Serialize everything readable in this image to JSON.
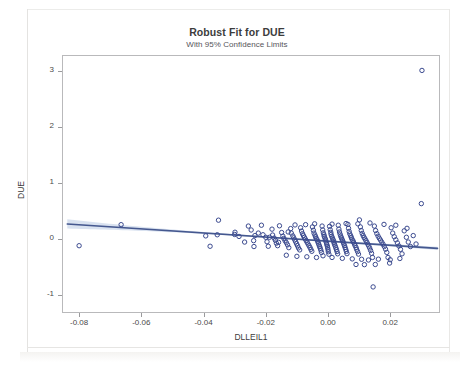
{
  "chart_data": {
    "type": "scatter",
    "title": "Robust Fit for DUE",
    "subtitle": "With 95% Confidence Limits",
    "xlabel": "DLLEIL1",
    "ylabel": "DUE",
    "xlim": [
      -0.0855,
      0.036
    ],
    "ylim": [
      -1.32,
      3.28
    ],
    "xticks": [
      -0.08,
      -0.06,
      -0.04,
      -0.02,
      0.0,
      0.02
    ],
    "xtick_labels": [
      "-0.08",
      "-0.06",
      "-0.04",
      "-0.02",
      "0.00",
      "0.02"
    ],
    "yticks": [
      -1,
      0,
      1,
      2,
      3
    ],
    "ytick_labels": [
      "-1",
      "0",
      "1",
      "2",
      "3"
    ],
    "grid": false,
    "legend": null,
    "marker": {
      "shape": "open-circle",
      "color": "#3b4a8f",
      "size": 4.4,
      "stroke_width": 1.0
    },
    "fit_line": {
      "label": "Robust fit",
      "color": "#45588f",
      "width": 1.6,
      "x_start": -0.0838,
      "y_start": 0.268,
      "x_end": 0.0352,
      "y_end": -0.168,
      "slope": -3.66,
      "intercept": -0.0386
    },
    "confidence_band": {
      "label": "95% Confidence Limits",
      "level": 0.95,
      "fill_color": "#b9cbe4",
      "opacity": 0.55,
      "half_width_at_xmin": 0.082,
      "half_width_at_center": 0.012,
      "half_width_at_xmax": 0.03
    },
    "points": [
      [
        -0.08,
        -0.12
      ],
      [
        -0.0665,
        0.255
      ],
      [
        -0.0393,
        0.055
      ],
      [
        -0.0352,
        0.335
      ],
      [
        -0.0356,
        0.075
      ],
      [
        -0.0379,
        -0.13
      ],
      [
        -0.03,
        0.08
      ],
      [
        -0.0299,
        0.12
      ],
      [
        -0.0256,
        0.23
      ],
      [
        -0.0247,
        0.16
      ],
      [
        -0.0235,
        0.06
      ],
      [
        -0.0239,
        -0.03
      ],
      [
        -0.0238,
        -0.135
      ],
      [
        -0.0214,
        0.245
      ],
      [
        -0.0209,
        0.075
      ],
      [
        -0.02,
        0.03
      ],
      [
        -0.0196,
        -0.05
      ],
      [
        -0.0192,
        -0.13
      ],
      [
        -0.018,
        0.175
      ],
      [
        -0.0178,
        0.07
      ],
      [
        -0.0173,
        0.015
      ],
      [
        -0.0169,
        -0.025
      ],
      [
        -0.0166,
        -0.075
      ],
      [
        -0.0162,
        -0.12
      ],
      [
        -0.0156,
        0.235
      ],
      [
        -0.0149,
        0.115
      ],
      [
        -0.0145,
        0.05
      ],
      [
        -0.0142,
        0.01
      ],
      [
        -0.0138,
        -0.03
      ],
      [
        -0.0134,
        -0.065
      ],
      [
        -0.013,
        -0.105
      ],
      [
        -0.0126,
        -0.155
      ],
      [
        -0.012,
        0.185
      ],
      [
        -0.0118,
        0.105
      ],
      [
        -0.0113,
        0.055
      ],
      [
        -0.011,
        0.02
      ],
      [
        -0.0107,
        -0.015
      ],
      [
        -0.0104,
        -0.05
      ],
      [
        -0.0101,
        -0.085
      ],
      [
        -0.0098,
        -0.12
      ],
      [
        -0.0095,
        -0.16
      ],
      [
        -0.0091,
        -0.195
      ],
      [
        -0.0088,
        0.2
      ],
      [
        -0.0085,
        0.14
      ],
      [
        -0.0082,
        0.095
      ],
      [
        -0.0079,
        0.06
      ],
      [
        -0.0076,
        0.03
      ],
      [
        -0.0073,
        0.0
      ],
      [
        -0.007,
        -0.03
      ],
      [
        -0.0067,
        -0.06
      ],
      [
        -0.0064,
        -0.09
      ],
      [
        -0.0061,
        -0.12
      ],
      [
        -0.0058,
        -0.15
      ],
      [
        -0.0055,
        -0.185
      ],
      [
        -0.0052,
        -0.22
      ],
      [
        -0.005,
        0.215
      ],
      [
        -0.0047,
        0.155
      ],
      [
        -0.0045,
        0.105
      ],
      [
        -0.0042,
        0.07
      ],
      [
        -0.004,
        0.04
      ],
      [
        -0.0038,
        0.012
      ],
      [
        -0.0035,
        -0.015
      ],
      [
        -0.0033,
        -0.045
      ],
      [
        -0.0031,
        -0.075
      ],
      [
        -0.0029,
        -0.105
      ],
      [
        -0.0027,
        -0.135
      ],
      [
        -0.0025,
        -0.165
      ],
      [
        -0.0023,
        -0.2
      ],
      [
        -0.0021,
        -0.24
      ],
      [
        -0.0019,
        0.23
      ],
      [
        -0.0017,
        0.16
      ],
      [
        -0.0015,
        0.11
      ],
      [
        -0.0013,
        0.075
      ],
      [
        -0.0012,
        0.045
      ],
      [
        -0.001,
        0.018
      ],
      [
        -0.0008,
        -0.01
      ],
      [
        -0.0007,
        -0.038
      ],
      [
        -0.0005,
        -0.068
      ],
      [
        -0.0004,
        -0.098
      ],
      [
        -0.0002,
        -0.128
      ],
      [
        -0.0001,
        -0.158
      ],
      [
        0.0,
        -0.19
      ],
      [
        0.0001,
        -0.228
      ],
      [
        0.0003,
        -0.272
      ],
      [
        0.0005,
        0.225
      ],
      [
        0.0007,
        0.165
      ],
      [
        0.0009,
        0.118
      ],
      [
        0.001,
        0.08
      ],
      [
        0.0012,
        0.048
      ],
      [
        0.0014,
        0.02
      ],
      [
        0.0016,
        -0.008
      ],
      [
        0.0018,
        -0.035
      ],
      [
        0.0019,
        -0.065
      ],
      [
        0.0021,
        -0.095
      ],
      [
        0.0023,
        -0.125
      ],
      [
        0.0025,
        -0.155
      ],
      [
        0.0027,
        -0.188
      ],
      [
        0.0029,
        -0.225
      ],
      [
        0.0031,
        -0.265
      ],
      [
        0.0033,
        0.245
      ],
      [
        0.0035,
        0.175
      ],
      [
        0.0037,
        0.125
      ],
      [
        0.0039,
        0.085
      ],
      [
        0.0041,
        0.05
      ],
      [
        0.0043,
        0.022
      ],
      [
        0.0045,
        -0.005
      ],
      [
        0.0047,
        -0.032
      ],
      [
        0.0049,
        -0.06
      ],
      [
        0.0051,
        -0.09
      ],
      [
        0.0053,
        -0.12
      ],
      [
        0.0055,
        -0.152
      ],
      [
        0.0057,
        -0.185
      ],
      [
        0.0059,
        -0.222
      ],
      [
        0.0061,
        -0.262
      ],
      [
        0.0064,
        0.26
      ],
      [
        0.0066,
        0.19
      ],
      [
        0.0068,
        0.135
      ],
      [
        0.007,
        0.092
      ],
      [
        0.0073,
        0.056
      ],
      [
        0.0075,
        0.026
      ],
      [
        0.0077,
        -0.002
      ],
      [
        0.008,
        -0.03
      ],
      [
        0.0082,
        -0.058
      ],
      [
        0.0085,
        -0.088
      ],
      [
        0.0087,
        -0.118
      ],
      [
        0.009,
        -0.15
      ],
      [
        0.0092,
        -0.185
      ],
      [
        0.0095,
        -0.225
      ],
      [
        0.0098,
        -0.27
      ],
      [
        0.0101,
        0.34
      ],
      [
        0.0104,
        0.215
      ],
      [
        0.0107,
        0.15
      ],
      [
        0.011,
        0.1
      ],
      [
        0.0113,
        0.06
      ],
      [
        0.0116,
        0.028
      ],
      [
        0.0119,
        0.0
      ],
      [
        0.0122,
        -0.03
      ],
      [
        0.0125,
        -0.06
      ],
      [
        0.0128,
        -0.092
      ],
      [
        0.0131,
        -0.125
      ],
      [
        0.0134,
        -0.162
      ],
      [
        0.0137,
        -0.205
      ],
      [
        0.014,
        -0.255
      ],
      [
        0.0143,
        -0.33
      ],
      [
        0.0145,
        -0.855
      ],
      [
        0.0149,
        0.23
      ],
      [
        0.0153,
        0.15
      ],
      [
        0.0157,
        0.095
      ],
      [
        0.0161,
        0.05
      ],
      [
        0.0165,
        0.012
      ],
      [
        0.0169,
        -0.022
      ],
      [
        0.0173,
        -0.058
      ],
      [
        0.0177,
        -0.095
      ],
      [
        0.0181,
        -0.135
      ],
      [
        0.0185,
        -0.182
      ],
      [
        0.0189,
        -0.24
      ],
      [
        0.0193,
        -0.33
      ],
      [
        0.0198,
        -0.43
      ],
      [
        0.0203,
        0.2
      ],
      [
        0.0208,
        0.105
      ],
      [
        0.0213,
        0.04
      ],
      [
        0.0218,
        -0.015
      ],
      [
        0.0223,
        -0.07
      ],
      [
        0.0228,
        -0.125
      ],
      [
        0.0233,
        -0.185
      ],
      [
        0.0238,
        -0.265
      ],
      [
        0.0245,
        0.145
      ],
      [
        0.0252,
        0.03
      ],
      [
        0.0258,
        -0.055
      ],
      [
        0.0265,
        -0.135
      ],
      [
        0.0274,
        0.06
      ],
      [
        0.0283,
        -0.09
      ],
      [
        0.03,
        0.63
      ],
      [
        0.0302,
        3.005
      ],
      [
        -0.0286,
        0.045
      ],
      [
        -0.0268,
        -0.055
      ],
      [
        -0.0224,
        0.105
      ],
      [
        -0.0188,
        0.03
      ],
      [
        -0.0159,
        -0.06
      ],
      [
        -0.0128,
        0.125
      ],
      [
        -0.0106,
        0.25
      ],
      [
        -0.0072,
        0.255
      ],
      [
        -0.0043,
        0.27
      ],
      [
        0.0013,
        0.265
      ],
      [
        0.0058,
        0.275
      ],
      [
        0.0096,
        0.27
      ],
      [
        0.0135,
        0.285
      ],
      [
        0.018,
        0.26
      ],
      [
        0.0218,
        0.245
      ],
      [
        0.0254,
        0.19
      ],
      [
        0.0013,
        -0.33
      ],
      [
        0.0046,
        -0.345
      ],
      [
        0.0078,
        -0.355
      ],
      [
        0.0108,
        -0.362
      ],
      [
        0.013,
        -0.375
      ],
      [
        0.0162,
        -0.36
      ],
      [
        0.02,
        -0.37
      ],
      [
        0.0231,
        -0.348
      ],
      [
        -0.0037,
        -0.33
      ],
      [
        -0.0068,
        -0.318
      ],
      [
        -0.01,
        -0.31
      ],
      [
        -0.0134,
        -0.29
      ],
      [
        0.0117,
        -0.458
      ],
      [
        0.0152,
        -0.455
      ],
      [
        0.009,
        -0.455
      ],
      [
        -0.0016,
        -0.3
      ]
    ]
  }
}
